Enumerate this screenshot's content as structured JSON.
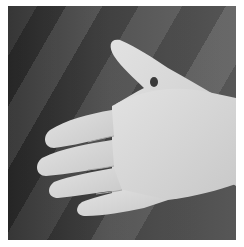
{
  "image": {
    "subject": "open palm of a hand with a dark marked point between thumb and index finger",
    "style": "grayscale photograph",
    "colors": {
      "background_dark": "#2e2e2e",
      "background_mid": "#5a5a5a",
      "skin": "#d6d6d6",
      "marker": "#3a3a3a",
      "frame": "#ffffff"
    }
  }
}
